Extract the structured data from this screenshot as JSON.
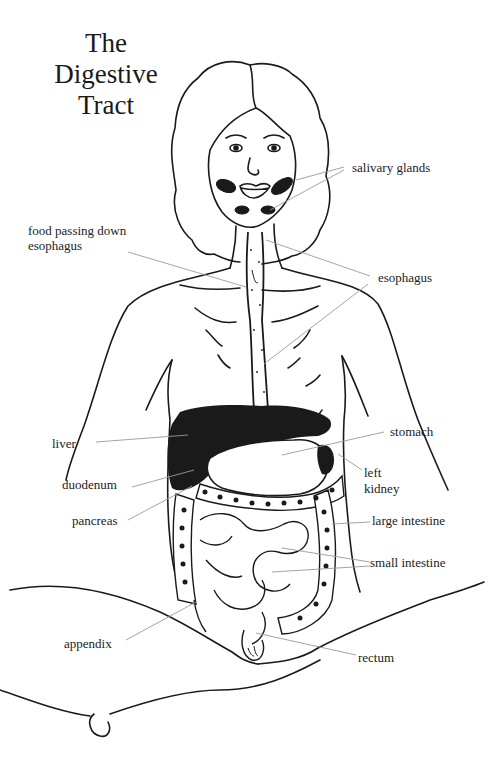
{
  "title": {
    "line1": "The Digestive",
    "line2": "Tract"
  },
  "labels": {
    "salivary_glands": "salivary glands",
    "food_passing_line1": "food passing down",
    "food_passing_line2": "esophagus",
    "esophagus": "esophagus",
    "liver": "liver",
    "stomach": "stomach",
    "left_kidney_line1": "left",
    "left_kidney_line2": "kidney",
    "duodenum": "duodenum",
    "pancreas": "pancreas",
    "large_intestine": "large intestine",
    "small_intestine": "small intestine",
    "appendix": "appendix",
    "rectum": "rectum"
  },
  "colors": {
    "ink": "#1a1a1a",
    "leader_line": "#9a9a9a",
    "background": "#ffffff"
  }
}
